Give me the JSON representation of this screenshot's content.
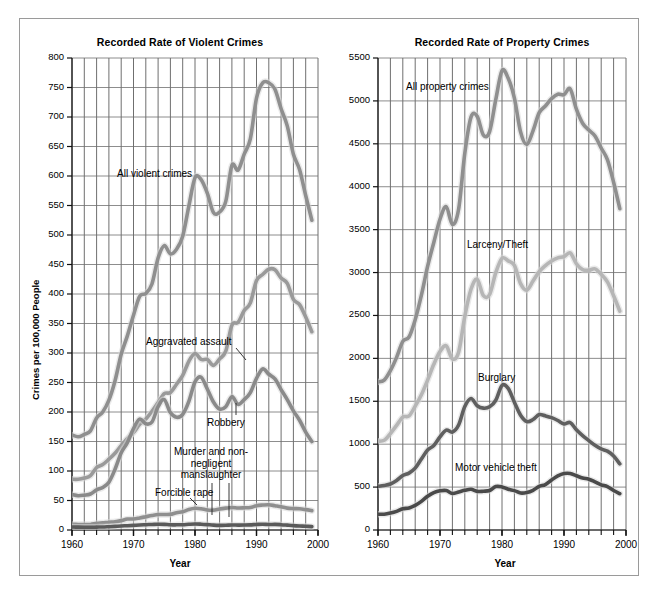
{
  "figure": {
    "background": "#ffffff",
    "border_color": "#9a9a9a"
  },
  "charts": [
    {
      "id": "violent",
      "title": "Recorded Rate of Violent Crimes",
      "xlabel": "Year",
      "ylabel": "Crimes per 100,000 People",
      "xticks": [
        "1960",
        "1970",
        "1980",
        "1990",
        "2000"
      ],
      "yticks": [
        "0",
        "50",
        "100",
        "150",
        "200",
        "250",
        "300",
        "350",
        "400",
        "450",
        "500",
        "550",
        "600",
        "650",
        "700",
        "750",
        "800"
      ],
      "labels": [
        {
          "text": "All violent crimes"
        },
        {
          "text": "Aggravated assault"
        },
        {
          "text": "Robbery"
        },
        {
          "text": "Murder and non-negligent manslaughter"
        },
        {
          "text": "Forcible rape"
        }
      ]
    },
    {
      "id": "property",
      "title": "Recorded Rate of Property Crimes",
      "xlabel": "Year",
      "ylabel": "",
      "xticks": [
        "1960",
        "1970",
        "1980",
        "1990",
        "2000"
      ],
      "yticks": [
        "0",
        "500",
        "1000",
        "1500",
        "2000",
        "2500",
        "3000",
        "3500",
        "4000",
        "4500",
        "5000",
        "5500"
      ],
      "labels": [
        {
          "text": "All property crimes"
        },
        {
          "text": "Larceny/Theft"
        },
        {
          "text": "Burglary"
        },
        {
          "text": "Motor vehicle theft"
        }
      ]
    }
  ],
  "chart_data": [
    {
      "type": "line",
      "title": "Recorded Rate of Violent Crimes",
      "xlabel": "Year",
      "ylabel": "Crimes per 100,000 People",
      "xlim": [
        1960,
        2000
      ],
      "ylim": [
        0,
        800
      ],
      "xticks": [
        1960,
        1970,
        1980,
        1990,
        2000
      ],
      "yticks": [
        0,
        50,
        100,
        150,
        200,
        250,
        300,
        350,
        400,
        450,
        500,
        550,
        600,
        650,
        700,
        750,
        800
      ],
      "grid": true,
      "grid_x_step": 2,
      "legend": "inline-labels",
      "x": [
        1960,
        1961,
        1962,
        1963,
        1964,
        1965,
        1966,
        1967,
        1968,
        1969,
        1970,
        1971,
        1972,
        1973,
        1974,
        1975,
        1976,
        1977,
        1978,
        1979,
        1980,
        1981,
        1982,
        1983,
        1984,
        1985,
        1986,
        1987,
        1988,
        1989,
        1990,
        1991,
        1992,
        1993,
        1994,
        1995,
        1996,
        1997,
        1998,
        1999
      ],
      "series": [
        {
          "name": "All violent crimes",
          "color": "#8f8f8f",
          "values": [
            161,
            158,
            162,
            168,
            190,
            200,
            220,
            253,
            298,
            329,
            364,
            396,
            401,
            417,
            461,
            482,
            468,
            476,
            498,
            549,
            597,
            594,
            571,
            538,
            539,
            557,
            618,
            610,
            637,
            663,
            732,
            758,
            758,
            747,
            714,
            685,
            637,
            611,
            567,
            525
          ]
        },
        {
          "name": "Aggravated assault",
          "color": "#9a9a9a",
          "values": [
            86,
            86,
            88,
            92,
            106,
            111,
            120,
            130,
            143,
            155,
            165,
            179,
            188,
            201,
            216,
            231,
            233,
            247,
            262,
            286,
            299,
            289,
            289,
            279,
            290,
            303,
            347,
            352,
            372,
            385,
            423,
            433,
            442,
            441,
            427,
            418,
            391,
            382,
            361,
            336
          ]
        },
        {
          "name": "Robbery",
          "color": "#8a8a8a",
          "values": [
            60,
            58,
            59,
            61,
            68,
            72,
            81,
            103,
            131,
            148,
            172,
            188,
            180,
            183,
            209,
            221,
            199,
            191,
            196,
            218,
            251,
            259,
            239,
            217,
            205,
            209,
            226,
            213,
            221,
            233,
            257,
            273,
            264,
            256,
            238,
            221,
            202,
            186,
            166,
            150
          ]
        },
        {
          "name": "Forcible rape",
          "color": "#8f8f8f",
          "values": [
            9.6,
            9.4,
            9.4,
            9.4,
            11.2,
            12.1,
            13.2,
            14.0,
            15.9,
            18.5,
            18.7,
            20.5,
            22.5,
            24.5,
            26.2,
            26.3,
            26.6,
            29.4,
            31.0,
            34.7,
            36.8,
            36.0,
            34.0,
            33.7,
            35.7,
            37.1,
            38.1,
            37.4,
            37.6,
            38.1,
            41.2,
            42.3,
            42.8,
            41.1,
            39.3,
            37.1,
            36.3,
            35.9,
            34.5,
            32.8
          ]
        },
        {
          "name": "Murder and non-negligent manslaughter",
          "color": "#5a5a5a",
          "values": [
            5.1,
            4.8,
            4.6,
            4.6,
            4.9,
            5.1,
            5.6,
            6.2,
            6.9,
            7.3,
            7.9,
            8.6,
            9.0,
            9.4,
            9.8,
            9.6,
            8.8,
            8.8,
            9.0,
            9.7,
            10.2,
            9.8,
            9.1,
            8.3,
            7.9,
            8.0,
            8.6,
            8.3,
            8.4,
            8.7,
            9.4,
            9.8,
            9.3,
            9.5,
            9.0,
            8.2,
            7.4,
            6.8,
            6.3,
            5.7
          ]
        }
      ]
    },
    {
      "type": "line",
      "title": "Recorded Rate of Property Crimes",
      "xlabel": "Year",
      "ylabel": "",
      "xlim": [
        1960,
        2000
      ],
      "ylim": [
        0,
        5500
      ],
      "xticks": [
        1960,
        1970,
        1980,
        1990,
        2000
      ],
      "yticks": [
        0,
        500,
        1000,
        1500,
        2000,
        2500,
        3000,
        3500,
        4000,
        4500,
        5000,
        5500
      ],
      "grid": true,
      "grid_x_step": 2,
      "legend": "inline-labels",
      "x": [
        1960,
        1961,
        1962,
        1963,
        1964,
        1965,
        1966,
        1967,
        1968,
        1969,
        1970,
        1971,
        1972,
        1973,
        1974,
        1975,
        1976,
        1977,
        1978,
        1979,
        1980,
        1981,
        1982,
        1983,
        1984,
        1985,
        1986,
        1987,
        1988,
        1989,
        1990,
        1991,
        1992,
        1993,
        1994,
        1995,
        1996,
        1997,
        1998,
        1999
      ],
      "series": [
        {
          "name": "All property crimes",
          "color": "#8f8f8f",
          "values": [
            1726,
            1747,
            1857,
            2012,
            2198,
            2249,
            2451,
            2737,
            3071,
            3351,
            3621,
            3769,
            3561,
            3737,
            4389,
            4811,
            4820,
            4602,
            4643,
            5017,
            5353,
            5264,
            5033,
            4637,
            4492,
            4651,
            4863,
            4940,
            5027,
            5078,
            5073,
            5140,
            4903,
            4740,
            4660,
            4591,
            4451,
            4316,
            4052,
            3744
          ]
        },
        {
          "name": "Larceny/Theft",
          "color": "#b6b6b6",
          "values": [
            1035,
            1045,
            1124,
            1219,
            1316,
            1329,
            1443,
            1576,
            1747,
            1931,
            2079,
            2146,
            1994,
            2072,
            2490,
            2805,
            2921,
            2730,
            2744,
            2999,
            3167,
            3136,
            3083,
            2871,
            2795,
            2901,
            3010,
            3081,
            3135,
            3171,
            3185,
            3229,
            3103,
            3034,
            3026,
            3043,
            2980,
            2891,
            2729,
            2551
          ]
        },
        {
          "name": "Burglary",
          "color": "#5f5f5f",
          "values": [
            509,
            519,
            536,
            576,
            635,
            663,
            721,
            827,
            932,
            984,
            1085,
            1164,
            1141,
            1223,
            1438,
            1532,
            1448,
            1420,
            1435,
            1512,
            1684,
            1650,
            1489,
            1338,
            1264,
            1287,
            1345,
            1330,
            1309,
            1276,
            1236,
            1252,
            1168,
            1100,
            1042,
            987,
            944,
            919,
            863,
            770
          ]
        },
        {
          "name": "Motor vehicle theft",
          "color": "#4a4a4a",
          "values": [
            183,
            184,
            197,
            217,
            247,
            257,
            287,
            334,
            393,
            436,
            457,
            460,
            426,
            443,
            462,
            474,
            450,
            452,
            460,
            506,
            502,
            475,
            459,
            431,
            437,
            463,
            508,
            529,
            583,
            630,
            658,
            659,
            632,
            606,
            592,
            561,
            526,
            506,
            460,
            423
          ]
        }
      ]
    }
  ]
}
